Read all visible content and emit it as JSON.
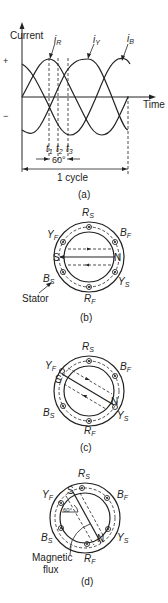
{
  "panel_a": {
    "ylabel": "Current",
    "xlabel": "Time",
    "plus": "+",
    "minus": "−",
    "series": [
      {
        "name": "i",
        "sub": "R"
      },
      {
        "name": "i",
        "sub": "Y"
      },
      {
        "name": "i",
        "sub": "B"
      }
    ],
    "times": [
      {
        "name": "t",
        "sub": "1"
      },
      {
        "name": "t",
        "sub": "2"
      },
      {
        "name": "t",
        "sub": "3"
      }
    ],
    "angle_label": "60°",
    "cycle_label": "1 cycle",
    "caption": "(a)"
  },
  "panel_b": {
    "labels": {
      "rs": "R",
      "rs_sub": "S",
      "rf": "R",
      "rf_sub": "F",
      "yf": "Y",
      "yf_sub": "F",
      "ys": "Y",
      "ys_sub": "S",
      "bf": "B",
      "bf_sub": "F",
      "bs": "B",
      "bs_sub": "S"
    },
    "pole_s": "S",
    "pole_n": "N",
    "stator_label": "Stator",
    "caption": "(b)"
  },
  "panel_c": {
    "labels": {
      "rs": "R",
      "rs_sub": "S",
      "rf": "R",
      "rf_sub": "F",
      "yf": "Y",
      "yf_sub": "F",
      "ys": "Y",
      "ys_sub": "S",
      "bf": "B",
      "bf_sub": "F",
      "bs": "B",
      "bs_sub": "S"
    },
    "pole_s": "S",
    "pole_n": "N",
    "caption": "(c)"
  },
  "panel_d": {
    "labels": {
      "rs": "R",
      "rs_sub": "S",
      "rf": "R",
      "rf_sub": "F",
      "yf": "Y",
      "yf_sub": "F",
      "ys": "Y",
      "ys_sub": "S",
      "bf": "B",
      "bf_sub": "F",
      "bs": "B",
      "bs_sub": "S"
    },
    "pole_s": "S",
    "pole_n": "N",
    "angle_label": "60°",
    "flux_label_1": "Magnetic",
    "flux_label_2": "flux",
    "caption": "(d)"
  }
}
